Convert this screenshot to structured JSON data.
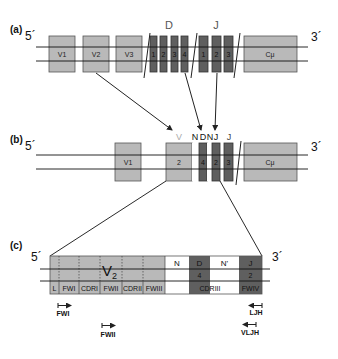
{
  "panel_a": {
    "label": "(a)",
    "five_prime": "5´",
    "three_prime": "3´",
    "v_segments": [
      "V1",
      "V2",
      "V3"
    ],
    "d_header": "D",
    "d_segments": [
      "1",
      "2",
      "3",
      "4"
    ],
    "j_header": "J",
    "j_segments": [
      "1",
      "2",
      "3"
    ],
    "constant": "Cμ"
  },
  "panel_b": {
    "label": "(b)",
    "five_prime": "5´",
    "three_prime": "3´",
    "v1": "V1",
    "v_header": "V",
    "v_rearranged": "2",
    "n_header": "N",
    "d_header": "D",
    "n2_header": "N'",
    "j_header_joined": "J",
    "j_header": "J",
    "d_rearranged": "4",
    "j_rearranged": "2",
    "j_remaining": "3",
    "constant": "Cμ"
  },
  "panel_c": {
    "label": "(c)",
    "five_prime": "5´",
    "three_prime": "3´",
    "v_label": "V",
    "v_sub": "2",
    "n_label": "N",
    "d_label": "D",
    "d_number": "4",
    "n2_label": "N'",
    "j_label": "J",
    "j_number": "2",
    "regions": [
      "L",
      "FWI",
      "CDRI",
      "FWII",
      "CDRII",
      "FWIII",
      "CDRIII",
      "FWIV"
    ],
    "primers": [
      {
        "name": "FWI",
        "direction": "forward"
      },
      {
        "name": "FWII",
        "direction": "forward"
      },
      {
        "name": "LJH",
        "direction": "reverse"
      },
      {
        "name": "VLJH",
        "direction": "reverse"
      }
    ]
  },
  "colors": {
    "v_segment": "#b9b9b9",
    "dj_segment": "#5f5f5f",
    "n_region": "#ffffff",
    "line": "#111111"
  }
}
